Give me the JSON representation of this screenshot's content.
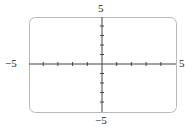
{
  "chart_data": {
    "type": "line",
    "title": "",
    "xlabel": "",
    "ylabel": "",
    "xlim": [
      -5,
      5
    ],
    "ylim": [
      -5,
      5
    ],
    "x_tick_step": 1,
    "y_tick_step": 1,
    "grid": false,
    "series": [],
    "tick_labels": {
      "x_min": "−5",
      "x_max": "5",
      "y_min": "−5",
      "y_max": "5"
    }
  },
  "colors": {
    "frame": "#b8b8b8",
    "axis": "#444444"
  }
}
